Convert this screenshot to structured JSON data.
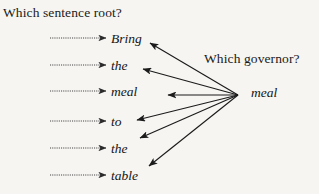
{
  "figure": {
    "name": "dependency-parsing-questions-diagram",
    "background_color": "#f6f5f2",
    "ink_color": "#1b1b1b"
  },
  "questions": {
    "left": "Which sentence root?",
    "right": "Which governor?"
  },
  "sentence": {
    "tokens": [
      {
        "text": "Bring",
        "x": 111,
        "y": 41
      },
      {
        "text": "the",
        "x": 111,
        "y": 68
      },
      {
        "text": "meal",
        "x": 111,
        "y": 94
      },
      {
        "text": "to",
        "x": 111,
        "y": 124
      },
      {
        "text": "the",
        "x": 111,
        "y": 151
      },
      {
        "text": "table",
        "x": 111,
        "y": 178
      }
    ]
  },
  "governor": {
    "token": "meal",
    "hub_x": 238,
    "hub_y": 95
  },
  "dotted_arrows": [
    {
      "target": "Bring",
      "x1": 50,
      "y1": 38,
      "x2": 106,
      "y2": 38
    },
    {
      "target": "the",
      "x1": 50,
      "y1": 65,
      "x2": 106,
      "y2": 65
    },
    {
      "target": "meal",
      "x1": 50,
      "y1": 91,
      "x2": 106,
      "y2": 91
    },
    {
      "target": "to",
      "x1": 50,
      "y1": 121,
      "x2": 106,
      "y2": 121
    },
    {
      "target": "the",
      "x1": 50,
      "y1": 148,
      "x2": 106,
      "y2": 148
    },
    {
      "target": "table",
      "x1": 50,
      "y1": 175,
      "x2": 106,
      "y2": 175
    }
  ],
  "governor_arrows": [
    {
      "target": "Bring",
      "x1": 238,
      "y1": 95,
      "x2": 150,
      "y2": 43
    },
    {
      "target": "the",
      "x1": 238,
      "y1": 95,
      "x2": 143,
      "y2": 69
    },
    {
      "target": "meal",
      "x1": 238,
      "y1": 95,
      "x2": 168,
      "y2": 95
    },
    {
      "target": "to",
      "x1": 238,
      "y1": 95,
      "x2": 137,
      "y2": 120
    },
    {
      "target": "the",
      "x1": 238,
      "y1": 95,
      "x2": 140,
      "y2": 138
    },
    {
      "target": "table",
      "x1": 238,
      "y1": 95,
      "x2": 149,
      "y2": 166
    }
  ]
}
